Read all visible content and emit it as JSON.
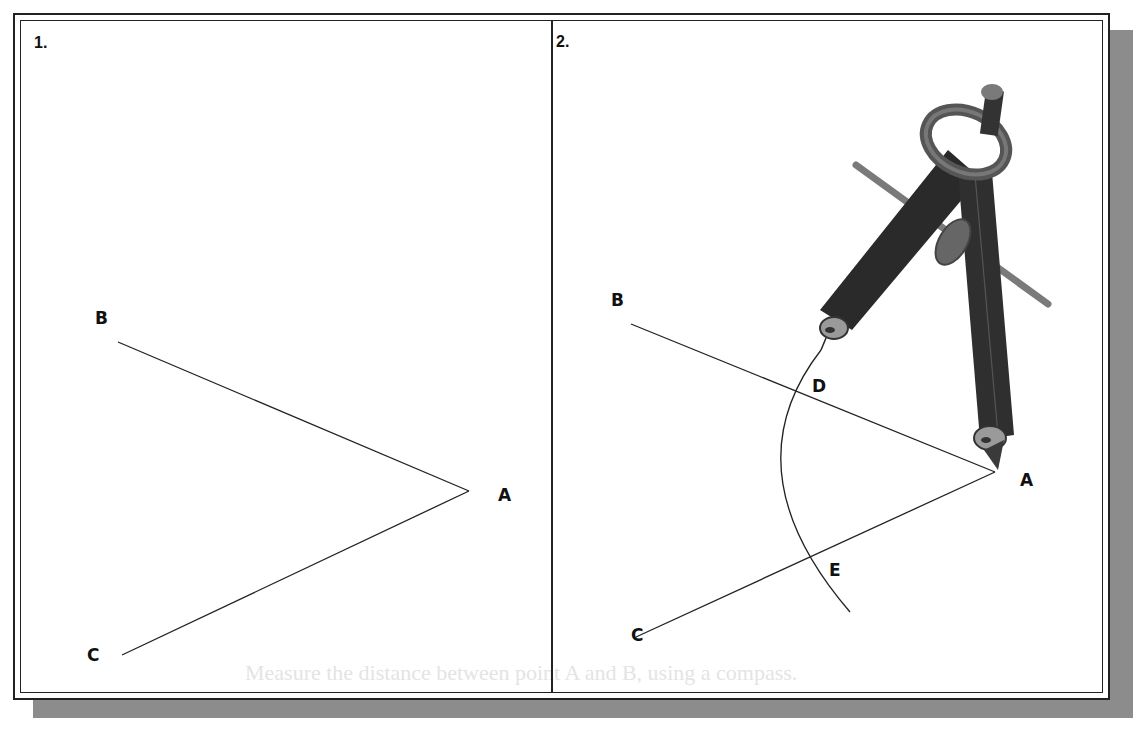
{
  "figure": {
    "panels": [
      {
        "label": "1.",
        "points": {
          "A": "A",
          "B": "B",
          "C": "C"
        }
      },
      {
        "label": "2.",
        "points": {
          "A": "A",
          "B": "B",
          "C": "C",
          "D": "D",
          "E": "E"
        }
      }
    ],
    "bleed_through_text": "Measure the distance between point A and B, using a compass."
  },
  "colors": {
    "line": "#222222",
    "shadow": "#8c8c8c",
    "compass_dark": "#2a2a2a",
    "compass_mid": "#6e6e6e",
    "compass_light": "#9a9a9a"
  }
}
